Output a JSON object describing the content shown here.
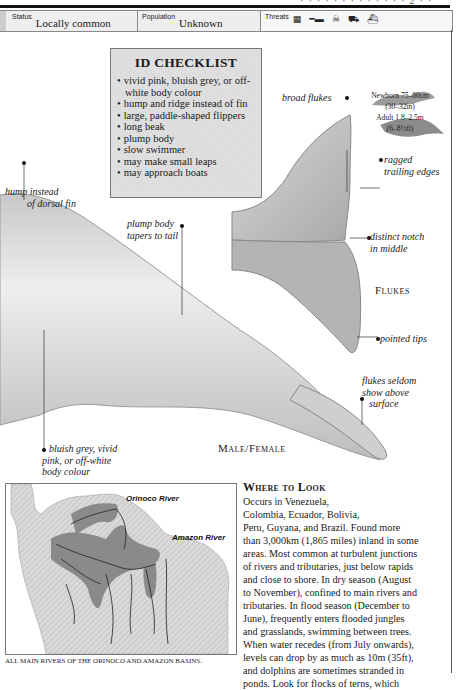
{
  "header": {
    "page_fragment": "· · · · · · · · · · · · ·   2 · ·"
  },
  "status_bar": {
    "status_label": "Status",
    "status_value": "Locally common",
    "population_label": "Population",
    "population_value": "Unknown",
    "threats_label": "Threats",
    "threat_icons": [
      "pollution-icon",
      "gun-icon",
      "poison-icon",
      "boat-icon",
      "habitat-loss-icon"
    ]
  },
  "id_checklist": {
    "title": "ID CHECKLIST",
    "items": [
      "vivid pink, bluish grey, or off-white body colour",
      "hump and ridge instead of fin",
      "large, paddle-shaped flippers",
      "long beak",
      "plump body",
      "slow swimmer",
      "may make small leaps",
      "may approach boats"
    ]
  },
  "sizes": {
    "newborn": "Newborn 75–80cm",
    "newborn_imperial": "(30–32in)",
    "adult": "Adult 1.8–2.5m",
    "adult_imperial": "(6–8½ft)"
  },
  "annotations": {
    "hump": "hump instead of dorsal fin",
    "hump_line1": "hump instead",
    "hump_line2": "of dorsal fin",
    "plump_line1": "plump body",
    "plump_line2": "tapers to tail",
    "broad_flukes": "broad flukes",
    "ragged_line1": "ragged",
    "ragged_line2": "trailing edges",
    "notch_line1": "distinct notch",
    "notch_line2": "in middle",
    "pointed_tips": "pointed tips",
    "seldom_line1": "flukes seldom",
    "seldom_line2": "show above",
    "seldom_line3": "surface",
    "colour_line1": "bluish grey, vivid",
    "colour_line2": "pink, or off-white",
    "colour_line3": "body colour"
  },
  "captions": {
    "flukes": "Flukes",
    "male_female": "Male/Female"
  },
  "map": {
    "orinoco_label": "Orinoco River",
    "amazon_label": "Amazon River",
    "caption": "ALL MAIN RIVERS OF THE ORINOCO AND AMAZON BASINS."
  },
  "where_to_look": {
    "heading": "Where to Look",
    "lines": [
      "Occurs in Venezuela,",
      "Colombia, Ecuador, Bolivia,",
      "Peru, Guyana, and Brazil. Found more",
      "than 3,000km (1,865 miles) inland in some",
      "areas. Most common at turbulent junctions",
      "of rivers and tributaries, just below rapids",
      "and close to shore. In dry season (August",
      "to November), confined to main rivers and",
      "tributaries. In flood season (December to",
      "June), frequently enters flooded jungles",
      "and grasslands, swimming between trees.",
      "When water recedes (from July onwards),",
      "levels can drop by as much as 10m (35ft),",
      "and dolphins are sometimes stranded in",
      "ponds. Look for flocks of terns, which"
    ]
  }
}
